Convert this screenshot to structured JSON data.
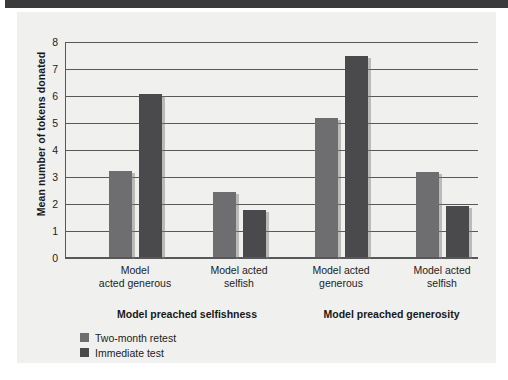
{
  "figure": {
    "panel_background": "#f0f0ee",
    "top_band_color": "#3a3a3c"
  },
  "chart_data": {
    "type": "bar",
    "title": "",
    "xlabel": "",
    "ylabel": "Mean number of tokens donated",
    "ylim": [
      0,
      8
    ],
    "ytick_labels": [
      "8",
      "7",
      "6",
      "5",
      "4",
      "3",
      "2",
      "1",
      "0"
    ],
    "ytick_values": [
      8,
      7,
      6,
      5,
      4,
      3,
      2,
      1,
      0
    ],
    "grid": true,
    "legend_position": "bottom-left",
    "categories": [
      "Model acted generous",
      "Model acted selfish",
      "Model acted generous",
      "Model acted selfish"
    ],
    "category_label_lines": [
      [
        "Model",
        "acted generous"
      ],
      [
        "Model acted",
        "selfish"
      ],
      [
        "Model acted",
        "generous"
      ],
      [
        "Model acted",
        "selfish"
      ]
    ],
    "group_headers": [
      {
        "label": "Model preached selfishness",
        "categories": [
          0,
          1
        ]
      },
      {
        "label": "Model preached generosity",
        "categories": [
          2,
          3
        ]
      }
    ],
    "series": [
      {
        "name": "Two-month retest",
        "color": "#6e6e70",
        "values": [
          3.2,
          2.4,
          5.15,
          3.15
        ]
      },
      {
        "name": "Immediate test",
        "color": "#4a4a4c",
        "values": [
          6.05,
          1.75,
          7.45,
          1.9
        ]
      }
    ]
  }
}
